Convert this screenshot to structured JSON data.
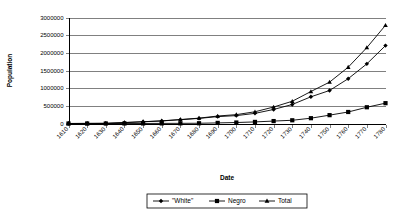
{
  "chart_data": {
    "type": "line",
    "title": "",
    "xlabel": "Date",
    "ylabel": "Population",
    "grid": true,
    "legend_position": "bottom",
    "x": [
      1610,
      1620,
      1630,
      1640,
      1650,
      1660,
      1670,
      1680,
      1690,
      1700,
      1710,
      1720,
      1730,
      1740,
      1750,
      1760,
      1770,
      1780
    ],
    "categories": [
      "1610",
      "1620",
      "1630",
      "1640",
      "1650",
      "1660",
      "1670",
      "1680",
      "1690",
      "1700",
      "1710",
      "1720",
      "1730",
      "1740",
      "1750",
      "1760",
      "1770",
      "1780"
    ],
    "xlim": [
      1610,
      1780
    ],
    "ylim": [
      0,
      3000000
    ],
    "y_ticks": [
      0,
      500000,
      1000000,
      1500000,
      2000000,
      2500000,
      3000000
    ],
    "y_tick_labels": [
      "0",
      "500000",
      "1000000",
      "1500000",
      "2000000",
      "2500000",
      "3000000"
    ],
    "series": [
      {
        "name": "\"White\"",
        "marker": "diamond",
        "values": [
          350,
          2180,
          4586,
          26037,
          48768,
          72138,
          107400,
          144536,
          194900,
          223100,
          286800,
          397300,
          538400,
          755500,
          934300,
          1267800,
          1688300,
          2204900
        ]
      },
      {
        "name": "Negro",
        "marker": "square",
        "values": [
          0,
          20,
          60,
          597,
          1600,
          2920,
          4535,
          6971,
          16729,
          27817,
          44866,
          68839,
          91021,
          150024,
          236420,
          325806,
          459822,
          575420
        ]
      },
      {
        "name": "Total",
        "marker": "triangle",
        "values": [
          350,
          2200,
          4646,
          26634,
          50368,
          75058,
          111935,
          151507,
          211629,
          250917,
          331666,
          466139,
          629421,
          905524,
          1170720,
          1593606,
          2148122,
          2780320
        ]
      }
    ]
  },
  "legend": {
    "entries": [
      {
        "label": "\"White\"",
        "marker": "diamond"
      },
      {
        "label": "Negro",
        "marker": "square"
      },
      {
        "label": "Total",
        "marker": "triangle"
      }
    ]
  }
}
